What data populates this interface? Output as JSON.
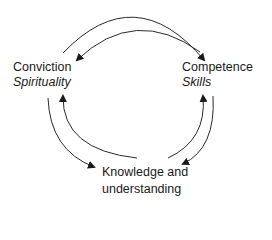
{
  "diagram": {
    "type": "cycle",
    "nodes": [
      {
        "id": "conviction",
        "title": "Conviction",
        "subtitle": "Spirituality"
      },
      {
        "id": "competence",
        "title": "Competence",
        "subtitle": "Skills"
      },
      {
        "id": "knowledge",
        "title_line1": "Knowledge and",
        "title_line2": "understanding"
      }
    ],
    "edges": [
      {
        "from": "conviction",
        "to": "competence"
      },
      {
        "from": "competence",
        "to": "conviction"
      },
      {
        "from": "competence",
        "to": "knowledge"
      },
      {
        "from": "knowledge",
        "to": "competence"
      },
      {
        "from": "knowledge",
        "to": "conviction"
      },
      {
        "from": "conviction",
        "to": "knowledge"
      }
    ],
    "colors": {
      "line": "#2a2a2a",
      "text": "#1a1a1a",
      "background": "#ffffff"
    }
  }
}
